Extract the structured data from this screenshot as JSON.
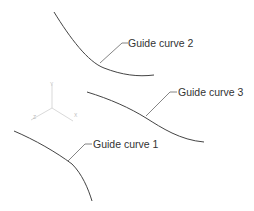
{
  "diagram": {
    "labels": {
      "guide_curve_1": "Guide curve 1",
      "guide_curve_2": "Guide curve 2",
      "guide_curve_3": "Guide curve 3"
    },
    "triad": {
      "x": "X",
      "y": "Y",
      "z": "Z"
    },
    "colors": {
      "curve": "#444444",
      "leader": "#666666",
      "triad": "#cccccc",
      "text": "#333333"
    }
  }
}
